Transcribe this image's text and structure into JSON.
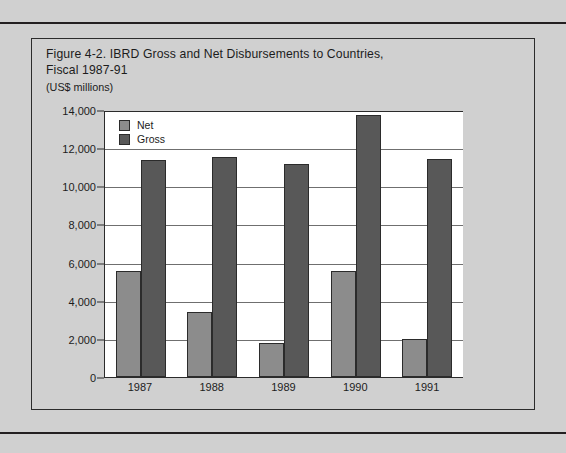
{
  "figure": {
    "title": "Figure 4-2.  IBRD Gross and Net Disbursements to Countries,\nFiscal 1987-91",
    "subtitle": "(US$ millions)"
  },
  "colors": {
    "net": "#8c8c8c",
    "gross": "#585858",
    "page_background": "#d0d0d0",
    "plot_background": "#ffffff",
    "axis": "#2b2b2b",
    "gridline": "#6f6f6f"
  },
  "chart_data": {
    "type": "bar",
    "title": "Figure 4-2.  IBRD Gross and Net Disbursements to Countries, Fiscal 1987-91",
    "subtitle": "(US$ millions)",
    "xlabel": "",
    "ylabel": "",
    "ylim": [
      0,
      14000
    ],
    "ytick_step": 2000,
    "ytick_labels": [
      "14,000",
      "12,000",
      "10,000",
      "8,000",
      "6,000",
      "4,000",
      "2,000",
      "0"
    ],
    "ytick_values": [
      14000,
      12000,
      10000,
      8000,
      6000,
      4000,
      2000,
      0
    ],
    "grid": true,
    "grid_axis": "y",
    "legend_position": "top-left-inside",
    "categories": [
      "1987",
      "1988",
      "1989",
      "1990",
      "1991"
    ],
    "series": [
      {
        "name": "Net",
        "color": "#8c8c8c",
        "values": [
          5600,
          3400,
          1800,
          5600,
          2000
        ]
      },
      {
        "name": "Gross",
        "color": "#585858",
        "values": [
          11400,
          11600,
          11200,
          13800,
          11450
        ]
      }
    ]
  }
}
